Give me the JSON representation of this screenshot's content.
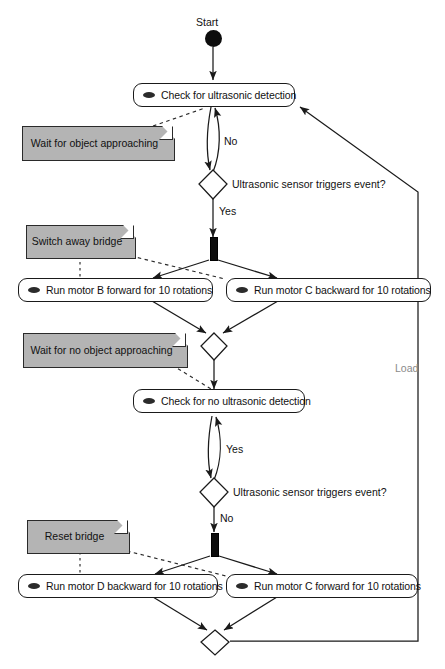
{
  "diagram": {
    "type": "uml-activity-diagram",
    "colors": {
      "note_fill": "#b4b4b4",
      "stroke": "#1a1a1a",
      "node_fill": "#0d0d0d",
      "muted_text": "#8a8a8a",
      "background": "#ffffff"
    }
  },
  "start": {
    "caption": "Start"
  },
  "activities": [
    {
      "id": "check-ultrasonic",
      "label": "Check for ultrasonic detection",
      "icon": "ellipse-icon"
    },
    {
      "id": "run-motor-b-forward",
      "label": "Run motor B forward for 10 rotations",
      "icon": "ellipse-icon"
    },
    {
      "id": "run-motor-c-backward",
      "label": "Run motor C backward for 10 rotations",
      "icon": "ellipse-icon"
    },
    {
      "id": "check-no-ultrasonic",
      "label": "Check for no ultrasonic detection",
      "icon": "ellipse-icon"
    },
    {
      "id": "run-motor-d-backward",
      "label": "Run motor D backward for 10 rotations",
      "icon": "ellipse-icon"
    },
    {
      "id": "run-motor-c-forward",
      "label": "Run motor C forward for 10 rotations",
      "icon": "ellipse-icon"
    }
  ],
  "decisions": [
    {
      "id": "decision-1",
      "label": "Ultrasonic sensor triggers event?"
    },
    {
      "id": "decision-2",
      "label": "Ultrasonic sensor triggers event?"
    }
  ],
  "notes": [
    {
      "id": "note-wait-object",
      "label": "Wait for object approaching"
    },
    {
      "id": "note-switch-bridge",
      "label": "Switch away bridge"
    },
    {
      "id": "note-wait-no-object",
      "label": "Wait for no object approaching"
    },
    {
      "id": "note-reset-bridge",
      "label": "Reset bridge"
    }
  ],
  "edge_labels": {
    "decision1_no": "No",
    "decision1_yes": "Yes",
    "decision2_yes": "Yes",
    "decision2_no": "No",
    "loopback": "Load"
  }
}
